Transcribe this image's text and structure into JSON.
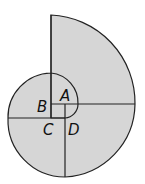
{
  "diagram": {
    "type": "spiral-of-arcs",
    "fill_color": "#d6d6d6",
    "stroke_color": "#222222",
    "labels": {
      "a": "A",
      "b": "B",
      "c": "C",
      "d": "D"
    }
  }
}
